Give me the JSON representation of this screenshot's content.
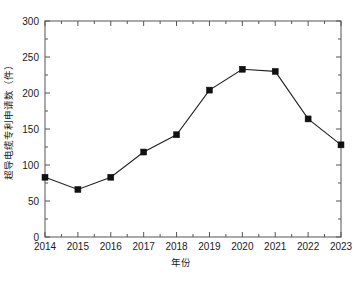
{
  "chart_data": {
    "type": "line",
    "title": "",
    "xlabel": "年份",
    "ylabel": "超导电缆专利申请数（件）",
    "categories": [
      "2014",
      "2015",
      "2016",
      "2017",
      "2018",
      "2019",
      "2020",
      "2021",
      "2022",
      "2023"
    ],
    "values": [
      83,
      66,
      83,
      118,
      142,
      204,
      233,
      230,
      164,
      128
    ],
    "series": [
      {
        "name": "超导电缆专利申请数",
        "values": [
          83,
          66,
          83,
          118,
          142,
          204,
          233,
          230,
          164,
          128
        ]
      }
    ],
    "ylim": [
      0,
      300
    ],
    "yticks": [
      0,
      50,
      100,
      150,
      200,
      250,
      300
    ],
    "ytick_labels": [
      "0",
      "50",
      "100",
      "150",
      "200",
      "250",
      "300"
    ],
    "xtick_labels": [
      "2014",
      "2015",
      "2016",
      "2017",
      "2018",
      "2019",
      "2020",
      "2021",
      "2022",
      "2023"
    ],
    "grid": false,
    "legend": "none",
    "marker": "square",
    "line_color": "#222222",
    "marker_color": "#111111",
    "axis_color": "#555555",
    "background_color": "#ffffff",
    "minor_ticks": true,
    "frame": "box"
  }
}
